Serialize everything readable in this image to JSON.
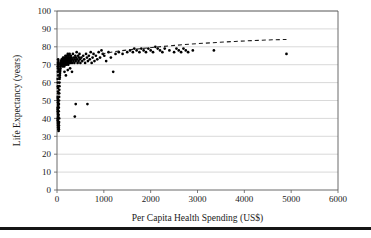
{
  "chart_data": {
    "type": "scatter",
    "title": "",
    "xlabel": "Per Capita Health Spending (US$)",
    "ylabel": "Life Expectancy (years)",
    "xlim": [
      0,
      6000
    ],
    "ylim": [
      0,
      100
    ],
    "xticks": [
      0,
      1000,
      2000,
      3000,
      4000,
      5000,
      6000
    ],
    "yticks": [
      0,
      10,
      20,
      30,
      40,
      50,
      60,
      70,
      80,
      90,
      100
    ],
    "xtick_labels": [
      "0",
      "1000",
      "2000",
      "3000",
      "4000",
      "5000",
      "6000"
    ],
    "ytick_labels": [
      "0",
      "10",
      "20",
      "30",
      "40",
      "50",
      "60",
      "70",
      "80",
      "90",
      "100"
    ],
    "grid": "horizontal",
    "legend": "none",
    "marker_color": "#000000",
    "gridline_color": "#c9c9c9",
    "axis_color": "#5a5a5a",
    "series": [
      {
        "name": "Countries",
        "marker": "dot",
        "points": [
          [
            18,
            69
          ],
          [
            22,
            71
          ],
          [
            25,
            68
          ],
          [
            28,
            70
          ],
          [
            30,
            72
          ],
          [
            32,
            67
          ],
          [
            20,
            66
          ],
          [
            24,
            73
          ],
          [
            26,
            64
          ],
          [
            29,
            70
          ],
          [
            31,
            69
          ],
          [
            33,
            71
          ],
          [
            15,
            62
          ],
          [
            17,
            60
          ],
          [
            19,
            58
          ],
          [
            21,
            57
          ],
          [
            23,
            55
          ],
          [
            27,
            54
          ],
          [
            16,
            52
          ],
          [
            18,
            51
          ],
          [
            20,
            50
          ],
          [
            22,
            49
          ],
          [
            24,
            48
          ],
          [
            26,
            47
          ],
          [
            14,
            46
          ],
          [
            16,
            45
          ],
          [
            18,
            44
          ],
          [
            20,
            43
          ],
          [
            22,
            42
          ],
          [
            25,
            41
          ],
          [
            15,
            40
          ],
          [
            17,
            39
          ],
          [
            19,
            38
          ],
          [
            21,
            37
          ],
          [
            23,
            36
          ],
          [
            27,
            35
          ],
          [
            30,
            34
          ],
          [
            34,
            33
          ],
          [
            36,
            35
          ],
          [
            38,
            37
          ],
          [
            40,
            34
          ],
          [
            42,
            36
          ],
          [
            44,
            38
          ],
          [
            46,
            40
          ],
          [
            35,
            42
          ],
          [
            37,
            44
          ],
          [
            39,
            46
          ],
          [
            41,
            48
          ],
          [
            43,
            50
          ],
          [
            45,
            52
          ],
          [
            47,
            54
          ],
          [
            49,
            56
          ],
          [
            51,
            58
          ],
          [
            53,
            60
          ],
          [
            55,
            62
          ],
          [
            57,
            63
          ],
          [
            60,
            64
          ],
          [
            63,
            65
          ],
          [
            66,
            66
          ],
          [
            69,
            67
          ],
          [
            72,
            68
          ],
          [
            75,
            69
          ],
          [
            78,
            70
          ],
          [
            81,
            70
          ],
          [
            84,
            71
          ],
          [
            87,
            71
          ],
          [
            90,
            72
          ],
          [
            95,
            72
          ],
          [
            100,
            73
          ],
          [
            105,
            70
          ],
          [
            110,
            71
          ],
          [
            115,
            72
          ],
          [
            120,
            69
          ],
          [
            125,
            73
          ],
          [
            130,
            74
          ],
          [
            135,
            70
          ],
          [
            140,
            72
          ],
          [
            145,
            71
          ],
          [
            150,
            73
          ],
          [
            155,
            69
          ],
          [
            160,
            74
          ],
          [
            165,
            72
          ],
          [
            170,
            70
          ],
          [
            175,
            73
          ],
          [
            180,
            75
          ],
          [
            185,
            71
          ],
          [
            190,
            72
          ],
          [
            195,
            74
          ],
          [
            200,
            70
          ],
          [
            205,
            73
          ],
          [
            210,
            75
          ],
          [
            215,
            72
          ],
          [
            220,
            71
          ],
          [
            225,
            74
          ],
          [
            230,
            76
          ],
          [
            235,
            73
          ],
          [
            240,
            70
          ],
          [
            245,
            72
          ],
          [
            250,
            75
          ],
          [
            255,
            74
          ],
          [
            260,
            71
          ],
          [
            265,
            73
          ],
          [
            270,
            76
          ],
          [
            275,
            72
          ],
          [
            280,
            74
          ],
          [
            285,
            71
          ],
          [
            290,
            73
          ],
          [
            295,
            75
          ],
          [
            300,
            72
          ],
          [
            310,
            74
          ],
          [
            320,
            71
          ],
          [
            330,
            73
          ],
          [
            340,
            76
          ],
          [
            350,
            72
          ],
          [
            360,
            74
          ],
          [
            370,
            71
          ],
          [
            380,
            73
          ],
          [
            390,
            75
          ],
          [
            400,
            72
          ],
          [
            410,
            74
          ],
          [
            420,
            77
          ],
          [
            430,
            73
          ],
          [
            440,
            71
          ],
          [
            450,
            75
          ],
          [
            460,
            72
          ],
          [
            470,
            74
          ],
          [
            480,
            76
          ],
          [
            490,
            73
          ],
          [
            500,
            71
          ],
          [
            520,
            74
          ],
          [
            540,
            72
          ],
          [
            560,
            75
          ],
          [
            580,
            73
          ],
          [
            600,
            71
          ],
          [
            620,
            76
          ],
          [
            640,
            74
          ],
          [
            660,
            72
          ],
          [
            680,
            75
          ],
          [
            700,
            73
          ],
          [
            720,
            77
          ],
          [
            740,
            71
          ],
          [
            760,
            74
          ],
          [
            780,
            76
          ],
          [
            800,
            72
          ],
          [
            830,
            75
          ],
          [
            860,
            73
          ],
          [
            890,
            77
          ],
          [
            920,
            74
          ],
          [
            950,
            78
          ],
          [
            980,
            76
          ],
          [
            160,
            66
          ],
          [
            190,
            64
          ],
          [
            230,
            67
          ],
          [
            280,
            68
          ],
          [
            320,
            66
          ],
          [
            380,
            41
          ],
          [
            400,
            48
          ],
          [
            650,
            48
          ],
          [
            1200,
            66
          ],
          [
            1010,
            75
          ],
          [
            1050,
            72
          ],
          [
            1100,
            77
          ],
          [
            1150,
            74
          ],
          [
            1250,
            76
          ],
          [
            1320,
            77
          ],
          [
            1400,
            76
          ],
          [
            1500,
            77
          ],
          [
            1560,
            78
          ],
          [
            1620,
            77
          ],
          [
            1650,
            79
          ],
          [
            1700,
            78
          ],
          [
            1760,
            77
          ],
          [
            1800,
            79
          ],
          [
            1850,
            78
          ],
          [
            1900,
            77
          ],
          [
            1950,
            79
          ],
          [
            2000,
            78
          ],
          [
            2050,
            77
          ],
          [
            2100,
            80
          ],
          [
            2150,
            79
          ],
          [
            2200,
            78
          ],
          [
            2250,
            77
          ],
          [
            2300,
            79
          ],
          [
            2400,
            78
          ],
          [
            2500,
            77
          ],
          [
            2550,
            79
          ],
          [
            2600,
            78
          ],
          [
            2650,
            77
          ],
          [
            2700,
            79
          ],
          [
            2750,
            78
          ],
          [
            2800,
            77
          ],
          [
            2900,
            78
          ],
          [
            3350,
            78
          ],
          [
            4900,
            76
          ]
        ]
      }
    ],
    "trendline": {
      "style": "dashed",
      "color": "#1a1a1a",
      "points": [
        [
          950,
          76.0
        ],
        [
          1200,
          77.2
        ],
        [
          1500,
          78.2
        ],
        [
          1800,
          79.0
        ],
        [
          2100,
          79.8
        ],
        [
          2400,
          80.5
        ],
        [
          2700,
          81.2
        ],
        [
          3000,
          81.8
        ],
        [
          3400,
          82.4
        ],
        [
          3800,
          83.0
        ],
        [
          4200,
          83.5
        ],
        [
          4600,
          83.9
        ],
        [
          4900,
          84.1
        ]
      ]
    }
  }
}
